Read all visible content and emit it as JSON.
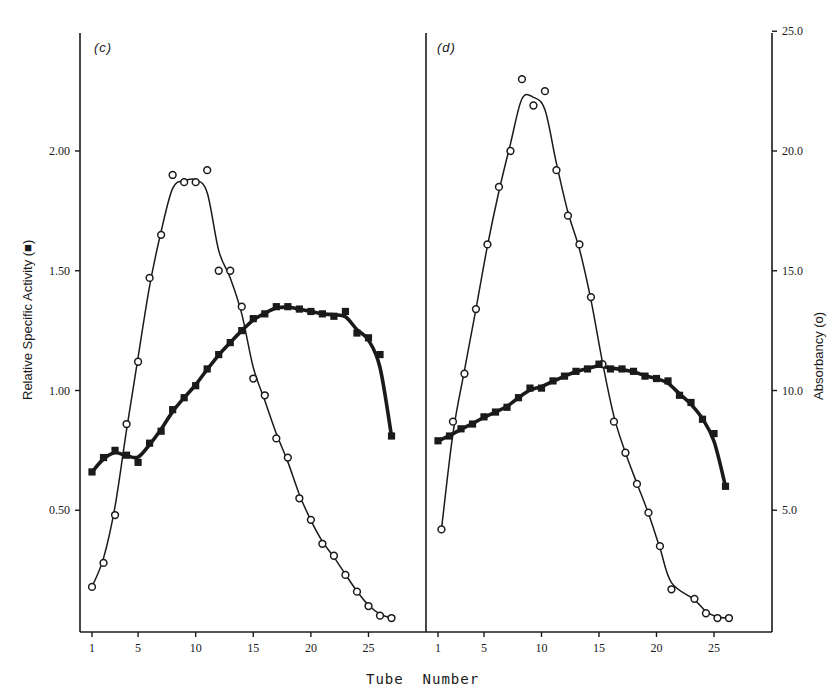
{
  "chart_data": [
    {
      "panel": "(c)",
      "type": "line",
      "xlabel": "Tube Number",
      "ylabel_left": "Relative Specific Activity (■)",
      "ylabel_right": "Absorbancy (o)",
      "x_ticks": [
        1,
        5,
        10,
        15,
        20,
        25
      ],
      "y_left_ticks": [
        "0.50",
        "1.00",
        "1.50",
        "2.00"
      ],
      "y_left_range": [
        0,
        2.5
      ],
      "series": [
        {
          "name": "Absorbancy (o)",
          "marker": "open-circle",
          "axis": "right",
          "x": [
            1,
            2,
            3,
            4,
            5,
            6,
            7,
            8,
            9,
            10,
            11,
            12,
            13,
            14,
            15,
            16,
            17,
            18,
            19,
            20,
            21,
            22,
            23,
            24,
            25,
            26,
            27
          ],
          "values": [
            1.8,
            2.8,
            4.8,
            8.6,
            11.2,
            14.7,
            16.5,
            19.0,
            18.7,
            18.7,
            19.2,
            15.0,
            15.0,
            13.5,
            10.5,
            9.8,
            8.0,
            7.2,
            5.5,
            4.6,
            3.6,
            3.1,
            2.3,
            1.6,
            1.0,
            0.6,
            0.5
          ]
        },
        {
          "name": "Relative Specific Activity (■)",
          "marker": "filled-square",
          "axis": "left",
          "x": [
            1,
            2,
            3,
            4,
            5,
            6,
            7,
            8,
            9,
            10,
            11,
            12,
            13,
            14,
            15,
            16,
            17,
            18,
            19,
            20,
            21,
            22,
            23,
            24,
            25,
            26,
            27
          ],
          "values": [
            0.66,
            0.72,
            0.75,
            0.73,
            0.7,
            0.78,
            0.83,
            0.92,
            0.97,
            1.02,
            1.09,
            1.15,
            1.2,
            1.25,
            1.3,
            1.32,
            1.35,
            1.35,
            1.34,
            1.33,
            1.32,
            1.31,
            1.33,
            1.24,
            1.22,
            1.15,
            0.81
          ]
        }
      ]
    },
    {
      "panel": "(d)",
      "type": "line",
      "xlabel": "Tube Number",
      "ylabel_right": "Absorbancy (o)",
      "x_ticks": [
        1,
        5,
        10,
        15,
        20,
        25
      ],
      "y_right_ticks": [
        "5.0",
        "10.0",
        "15.0",
        "20.0",
        "25.0"
      ],
      "y_right_range": [
        0,
        25
      ],
      "series": [
        {
          "name": "Absorbancy (o)",
          "marker": "open-circle",
          "axis": "right",
          "x": [
            1.3,
            2.3,
            3.3,
            4.3,
            5.3,
            6.3,
            7.3,
            8.3,
            9.3,
            10.3,
            11.3,
            12.3,
            13.3,
            14.3,
            15.3,
            16.3,
            17.3,
            18.3,
            19.3,
            20.3,
            21.3,
            23.3,
            24.3,
            25.3,
            26.3
          ],
          "values": [
            4.2,
            8.7,
            10.7,
            13.4,
            16.1,
            18.5,
            20.0,
            23.0,
            21.9,
            22.5,
            19.2,
            17.3,
            16.1,
            13.9,
            11.1,
            8.7,
            7.4,
            6.1,
            4.9,
            3.5,
            1.7,
            1.3,
            0.7,
            0.5,
            0.5
          ]
        },
        {
          "name": "Relative Specific Activity (■)",
          "marker": "filled-square",
          "axis": "left",
          "x": [
            1,
            2,
            3,
            4,
            5,
            6,
            7,
            8,
            9,
            10,
            11,
            12,
            13,
            14,
            15,
            16,
            17,
            18,
            19,
            20,
            21,
            22,
            23,
            24,
            25,
            26
          ],
          "values": [
            0.79,
            0.81,
            0.84,
            0.86,
            0.89,
            0.91,
            0.93,
            0.97,
            1.01,
            1.01,
            1.04,
            1.06,
            1.08,
            1.09,
            1.11,
            1.09,
            1.09,
            1.08,
            1.06,
            1.05,
            1.04,
            0.98,
            0.95,
            0.88,
            0.82,
            0.6
          ]
        }
      ]
    }
  ],
  "labels": {
    "panel_c": "(c)",
    "panel_d": "(d)",
    "x_title": "Tube  Number",
    "y_left_title": "Relative Specific Activity (■)",
    "y_right_title": "Absorbancy (o)",
    "x_ticks": [
      "1",
      "5",
      "10",
      "15",
      "20",
      "25"
    ],
    "y_left_ticks": [
      "2.00",
      "1.50",
      "1.00",
      "0.50"
    ],
    "y_right_ticks": [
      "25.0",
      "20.0",
      "15.0",
      "10.0",
      "5.0"
    ]
  }
}
